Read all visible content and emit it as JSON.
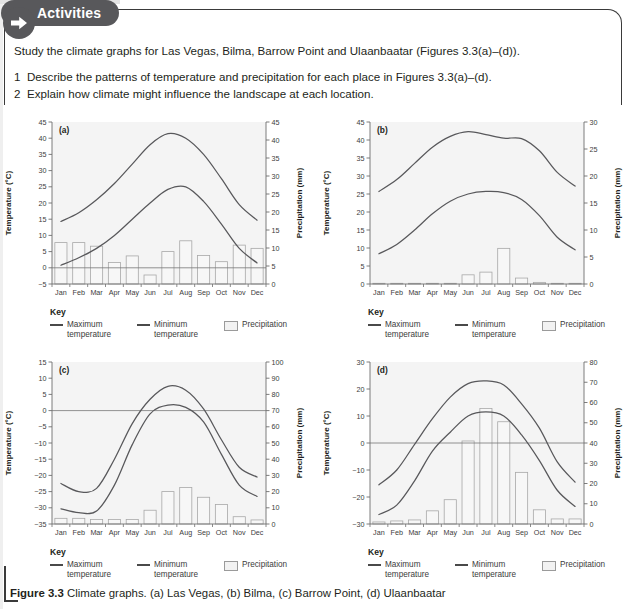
{
  "panel": {
    "tab_label": "Activities",
    "arrow_icon": "arrow-right-icon",
    "intro": "Study the climate graphs for Las Vegas, Bilma, Barrow Point and Ulaanbaatar (Figures 3.3(a)–(d)).",
    "questions": [
      {
        "num": "1",
        "text": "Describe the patterns of temperature and precipitation for each place in Figures 3.3(a)–(d)."
      },
      {
        "num": "2",
        "text": "Explain how climate might influence the landscape at each location."
      }
    ]
  },
  "key": {
    "title": "Key",
    "max_label": "Maximum temperature",
    "min_label": "Minimum temperature",
    "precip_label": "Precipitation"
  },
  "caption": {
    "bold": "Figure 3.3",
    "rest": " Climate graphs. (a) Las Vegas, (b) Bilma, (c) Barrow Point, (d) Ulaanbaatar"
  },
  "colors": {
    "plot_bg": "#f4f4f4",
    "line": "#58585b",
    "bar_fill": "#f7f7f7",
    "bar_stroke": "#a8a8a8",
    "axis": "#6e6e6e",
    "tab_bg": "#58585b"
  },
  "chart_data": [
    {
      "type": "line",
      "panel": "(a)",
      "title": "Las Vegas",
      "xlabel": "",
      "ylabel": "Temperature (°C)",
      "y2label": "Precipitation (mm)",
      "categories": [
        "Jan",
        "Feb",
        "Mar",
        "Apr",
        "May",
        "Jun",
        "Jul",
        "Aug",
        "Sep",
        "Oct",
        "Nov",
        "Dec"
      ],
      "ylim": [
        -5,
        45
      ],
      "yticks": [
        -5,
        0,
        5,
        10,
        15,
        20,
        25,
        30,
        35,
        40,
        45
      ],
      "y2lim": [
        0,
        45
      ],
      "y2ticks": [
        0,
        5,
        10,
        15,
        20,
        25,
        30,
        35,
        40,
        45
      ],
      "grid": false,
      "series": [
        {
          "name": "Maximum temperature",
          "kind": "line",
          "values": [
            14.3,
            17.0,
            21.0,
            26.0,
            32.0,
            38.0,
            41.4,
            40.0,
            35.0,
            27.5,
            19.5,
            14.7
          ]
        },
        {
          "name": "Minimum temperature",
          "kind": "line",
          "values": [
            0.8,
            3.1,
            6.0,
            10.0,
            15.0,
            20.0,
            24.2,
            25.0,
            20.5,
            13.5,
            6.0,
            1.5
          ]
        },
        {
          "name": "Precipitation",
          "kind": "bar",
          "values": [
            11.5,
            11.5,
            10.5,
            6.0,
            7.8,
            2.5,
            9.0,
            12.0,
            7.9,
            6.2,
            10.8,
            9.9
          ]
        }
      ]
    },
    {
      "type": "line",
      "panel": "(b)",
      "title": "Bilma",
      "xlabel": "",
      "ylabel": "Temperature (°C)",
      "y2label": "Precipitation (mm)",
      "categories": [
        "Jan",
        "Feb",
        "Mar",
        "Apr",
        "May",
        "Jun",
        "Jul",
        "Aug",
        "Sep",
        "Oct",
        "Nov",
        "Dec"
      ],
      "ylim": [
        0,
        45
      ],
      "yticks": [
        0,
        5,
        10,
        15,
        20,
        25,
        30,
        35,
        40,
        45
      ],
      "y2lim": [
        0,
        30
      ],
      "y2ticks": [
        0,
        5,
        10,
        15,
        20,
        25,
        30
      ],
      "grid": false,
      "series": [
        {
          "name": "Maximum temperature",
          "kind": "line",
          "values": [
            25.7,
            29.0,
            33.5,
            38.0,
            41.0,
            42.3,
            41.5,
            40.5,
            40.4,
            37.0,
            31.0,
            27.2
          ]
        },
        {
          "name": "Minimum temperature",
          "kind": "line",
          "values": [
            8.4,
            11.0,
            15.0,
            19.5,
            23.0,
            25.0,
            25.7,
            25.4,
            23.5,
            19.0,
            13.0,
            9.5
          ]
        },
        {
          "name": "Precipitation",
          "kind": "bar",
          "values": [
            0.1,
            0.0,
            0.0,
            0.0,
            0.1,
            1.7,
            2.2,
            6.6,
            1.1,
            0.3,
            0.1,
            0.1
          ]
        }
      ]
    },
    {
      "type": "line",
      "panel": "(c)",
      "title": "Barrow Point",
      "xlabel": "",
      "ylabel": "Temperature (°C)",
      "y2label": "Precipitation (mm)",
      "categories": [
        "Jan",
        "Feb",
        "Mar",
        "Apr",
        "May",
        "Jun",
        "Jul",
        "Aug",
        "Sep",
        "Oct",
        "Nov",
        "Dec"
      ],
      "ylim": [
        -35,
        15
      ],
      "yticks": [
        -35,
        -30,
        -25,
        -20,
        -15,
        -10,
        -5,
        0,
        5,
        10,
        15
      ],
      "y2lim": [
        0,
        100
      ],
      "y2ticks": [
        0,
        10,
        20,
        30,
        40,
        50,
        60,
        70,
        80,
        90,
        100
      ],
      "grid": false,
      "series": [
        {
          "name": "Maximum temperature",
          "kind": "line",
          "values": [
            -22.5,
            -25.0,
            -24.0,
            -15.0,
            -4.0,
            3.5,
            7.5,
            6.3,
            0.5,
            -9.0,
            -17.5,
            -20.5
          ]
        },
        {
          "name": "Minimum temperature",
          "kind": "line",
          "values": [
            -30.3,
            -31.5,
            -31.0,
            -23.0,
            -10.5,
            -1.0,
            1.7,
            1.0,
            -3.5,
            -13.5,
            -23.0,
            -26.5
          ]
        },
        {
          "name": "Precipitation",
          "kind": "bar",
          "values": [
            3.5,
            3.5,
            2.8,
            2.8,
            2.8,
            8.5,
            20.0,
            22.5,
            16.5,
            12.0,
            4.5,
            2.5
          ]
        }
      ]
    },
    {
      "type": "line",
      "panel": "(d)",
      "title": "Ulaanbaatar",
      "xlabel": "",
      "ylabel": "Temperature (°C)",
      "y2label": "Precipitation (mm)",
      "categories": [
        "Jan",
        "Feb",
        "Mar",
        "Apr",
        "May",
        "Jun",
        "Jul",
        "Aug",
        "Sep",
        "Oct",
        "Nov",
        "Dec"
      ],
      "ylim": [
        -30,
        30
      ],
      "yticks": [
        -30,
        -20,
        -10,
        0,
        10,
        20,
        30
      ],
      "y2lim": [
        0,
        80
      ],
      "y2ticks": [
        0,
        10,
        20,
        30,
        40,
        50,
        60,
        70,
        80
      ],
      "grid": false,
      "series": [
        {
          "name": "Maximum temperature",
          "kind": "line",
          "values": [
            -15.5,
            -10.0,
            -0.5,
            9.0,
            17.0,
            22.0,
            23.0,
            21.5,
            14.5,
            5.5,
            -7.0,
            -14.5
          ]
        },
        {
          "name": "Minimum temperature",
          "kind": "line",
          "values": [
            -26.5,
            -23.0,
            -14.0,
            -3.0,
            4.0,
            10.0,
            11.5,
            10.0,
            3.0,
            -6.5,
            -17.5,
            -23.5
          ]
        },
        {
          "name": "Precipitation",
          "kind": "bar",
          "values": [
            1.0,
            1.5,
            2.0,
            6.5,
            12.0,
            41.0,
            57.0,
            50.5,
            25.5,
            7.0,
            2.5,
            2.5
          ]
        }
      ]
    }
  ]
}
